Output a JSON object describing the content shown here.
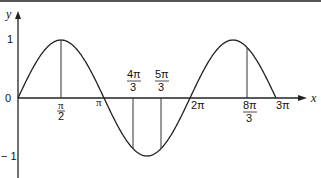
{
  "chart_data": {
    "type": "line",
    "title": "",
    "function": "y = sin(x)",
    "xlabel": "x",
    "ylabel": "y",
    "xlim": [
      0,
      9.42477796
    ],
    "ylim": [
      -1,
      1
    ],
    "grid": false,
    "legend": null,
    "x_tick_labels": [
      "π/2",
      "π",
      "4π/3",
      "5π/3",
      "2π",
      "8π/3",
      "3π"
    ],
    "y_tick_labels": [
      "1",
      "0",
      "-1"
    ],
    "vertical_markers": [
      {
        "label": "π/2",
        "x": 1.5708,
        "y": 1
      },
      {
        "label": "4π/3",
        "x": 4.1888,
        "y": -0.866
      },
      {
        "label": "5π/3",
        "x": 5.236,
        "y": -0.866
      },
      {
        "label": "8π/3",
        "x": 8.3776,
        "y": 0.866
      }
    ],
    "series": [
      {
        "name": "sin x",
        "x": [
          0,
          0.5236,
          1.0472,
          1.5708,
          2.0944,
          2.618,
          3.1416,
          3.6652,
          4.1888,
          4.7124,
          5.236,
          5.7596,
          6.2832,
          6.8068,
          7.3304,
          7.854,
          8.3776,
          8.9012,
          9.4248
        ],
        "values": [
          0,
          0.5,
          0.866,
          1,
          0.866,
          0.5,
          0,
          -0.5,
          -0.866,
          -1,
          -0.866,
          -0.5,
          0,
          0.5,
          0.866,
          1,
          0.866,
          0.5,
          0
        ]
      }
    ]
  },
  "labels": {
    "y_axis": "y",
    "x_axis": "x",
    "y_one": "1",
    "y_zero": "0",
    "y_neg_one": "− 1",
    "pi_half_num": "π",
    "pi_half_den": "2",
    "pi": "π",
    "four_pi_three_num": "4π",
    "four_pi_three_den": "3",
    "five_pi_three_num": "5π",
    "five_pi_three_den": "3",
    "two_pi": "2π",
    "eight_pi_three_num": "8π",
    "eight_pi_three_den": "3",
    "three_pi": "3π"
  },
  "colors": {
    "curve": "#222222",
    "axis": "#222222",
    "background": "#ffffff"
  }
}
